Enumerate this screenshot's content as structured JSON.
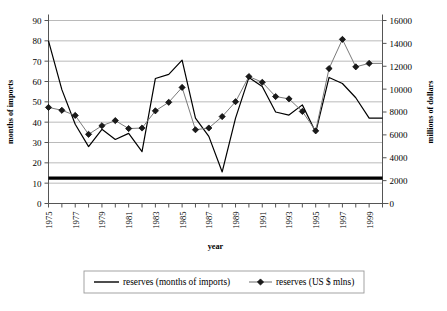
{
  "chart_data": {
    "type": "line",
    "title": "",
    "xlabel": "year",
    "ylabel": "months of imports",
    "y2label": "millions of dollars",
    "grid": true,
    "legend_position": "bottom",
    "ylim": [
      0,
      90
    ],
    "y2lim": [
      0,
      16000
    ],
    "ytick_labels": [
      "0",
      "10",
      "20",
      "30",
      "40",
      "50",
      "60",
      "70",
      "80",
      "90"
    ],
    "ytick_values": [
      0,
      10,
      20,
      30,
      40,
      50,
      60,
      70,
      80,
      90
    ],
    "y2tick_labels": [
      "0",
      "2000",
      "4000",
      "6000",
      "8000",
      "10000",
      "12000",
      "14000",
      "16000"
    ],
    "y2tick_values": [
      0,
      2000,
      4000,
      6000,
      8000,
      10000,
      12000,
      14000,
      16000
    ],
    "x": [
      1975,
      1976,
      1977,
      1978,
      1979,
      1980,
      1981,
      1982,
      1983,
      1984,
      1985,
      1986,
      1987,
      1988,
      1989,
      1990,
      1991,
      1992,
      1993,
      1994,
      1995,
      1996,
      1997,
      1998,
      1999,
      2000
    ],
    "xtick_labels": [
      "1975",
      "1977",
      "1979",
      "1981",
      "1983",
      "1985",
      "1987",
      "1989",
      "1991",
      "1993",
      "1995",
      "1997",
      "1999"
    ],
    "xtick_values": [
      1975,
      1977,
      1979,
      1981,
      1983,
      1985,
      1987,
      1989,
      1991,
      1993,
      1995,
      1997,
      1999
    ],
    "series": [
      {
        "name": "reserves (months of imports)",
        "axis": "left",
        "marker": "none",
        "color": "#000000",
        "linewidth": 3.4,
        "values": [
          12.5,
          12.5,
          12.5,
          12.5,
          12.5,
          12.5,
          12.5,
          12.5,
          12.5,
          12.5,
          12.5,
          12.5,
          12.5,
          12.5,
          12.5,
          12.5,
          12.5,
          12.5,
          12.5,
          12.5,
          12.5,
          12.5,
          12.5,
          12.5,
          12.5,
          12.5
        ]
      },
      {
        "name": "reserves (US $ mlns)",
        "axis": "right",
        "marker": "diamond",
        "color": "#7a7a7a",
        "linewidth": 1,
        "values": [
          8400,
          8150,
          7700,
          6050,
          6800,
          7250,
          6550,
          6600,
          8100,
          8850,
          10150,
          6450,
          6600,
          7600,
          8900,
          11100,
          10600,
          9350,
          9150,
          8050,
          6350,
          11800,
          14350,
          11950,
          12250,
          12250
        ]
      },
      {
        "name": "reserves (US $ mlns) plotted on left scale",
        "axis": "left",
        "marker": "none",
        "color": "#000000",
        "linewidth": 1.2,
        "values": [
          80.0,
          56.0,
          39.0,
          28.0,
          36.5,
          31.5,
          34.5,
          25.5,
          61.5,
          63.5,
          70.5,
          42.0,
          33.0,
          15.5,
          42.0,
          62.0,
          57.5,
          45.0,
          43.5,
          48.5,
          35.0,
          62.0,
          59.0,
          52.0,
          42.0,
          42.0
        ]
      }
    ],
    "legend": [
      {
        "label": "reserves (months of imports)",
        "marker": "none",
        "color": "#000000"
      },
      {
        "label": "reserves (US $ mlns)",
        "marker": "diamond",
        "color": "#7a7a7a"
      }
    ]
  },
  "caption": ""
}
